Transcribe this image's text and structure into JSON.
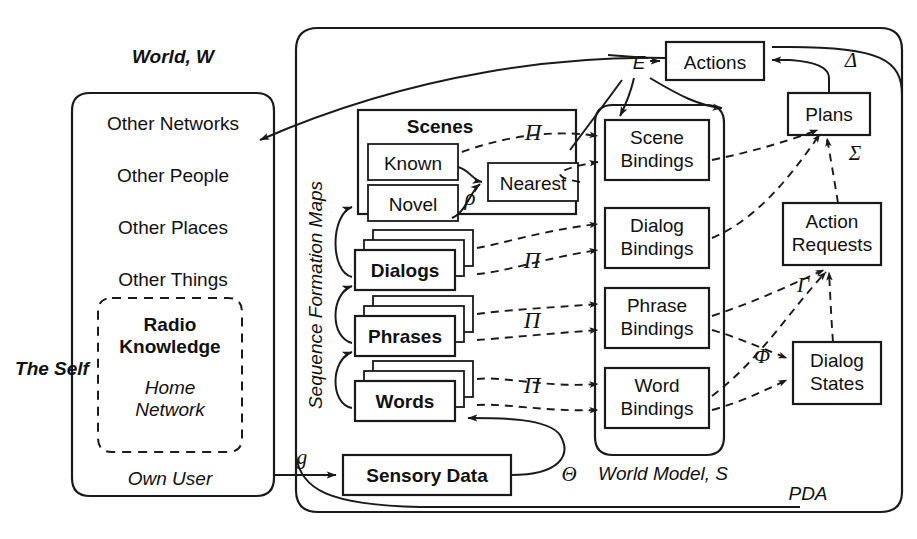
{
  "diagram": {
    "outer_label": "PDA"
  },
  "world": {
    "title": "World, W",
    "self_label": "The Self",
    "items": [
      "Other Networks",
      "Other People",
      "Other Places",
      "Other Things"
    ],
    "own_user": "Own User",
    "self_box": {
      "line1": "Radio",
      "line2": "Knowledge",
      "line3": "Home",
      "line4": "Network"
    }
  },
  "sfm": {
    "label": "Sequence Formation Maps",
    "scenes": {
      "title": "Scenes",
      "known": "Known",
      "novel": "Novel",
      "nearest": "Nearest",
      "rho": "ρ"
    },
    "stacks": [
      {
        "label": "Dialogs",
        "pi": "Π"
      },
      {
        "label": "Phrases",
        "pi": "Π"
      },
      {
        "label": "Words",
        "pi": "Π"
      }
    ],
    "scene_pi": "Π"
  },
  "world_model": {
    "label": "World Model, S",
    "bindings": [
      {
        "line1": "Scene",
        "line2": "Bindings"
      },
      {
        "line1": "Dialog",
        "line2": "Bindings"
      },
      {
        "line1": "Phrase",
        "line2": "Bindings"
      },
      {
        "line1": "Word",
        "line2": "Bindings"
      }
    ]
  },
  "right_column": {
    "actions": "Actions",
    "plans": "Plans",
    "action_requests": {
      "line1": "Action",
      "line2": "Requests"
    },
    "dialog_states": {
      "line1": "Dialog",
      "line2": "States"
    }
  },
  "sensory": {
    "label": "Sensory Data",
    "theta": "Θ",
    "g": "g"
  },
  "symbols": {
    "E": "E",
    "delta": "Δ",
    "sigma": "Σ",
    "gamma": "Γ",
    "phi": "Φ"
  },
  "colors": {
    "stroke": "#1a1a1a",
    "background": "#ffffff"
  }
}
